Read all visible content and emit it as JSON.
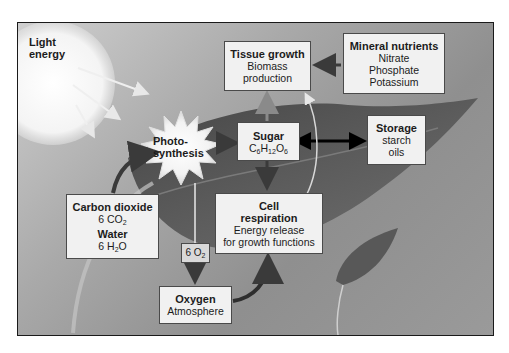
{
  "diagram": {
    "nodes": {
      "light": {
        "line1": "Light",
        "line2": "energy"
      },
      "photosynthesis": {
        "line1": "Photo-",
        "line2": "synthesis"
      },
      "tissue_growth": {
        "title": "Tissue growth",
        "line1": "Biomass",
        "line2": "production"
      },
      "mineral_nutrients": {
        "title": "Mineral nutrients",
        "items": [
          "Nitrate",
          "Phosphate",
          "Potassium"
        ]
      },
      "sugar": {
        "title": "Sugar",
        "formula": {
          "c": "C",
          "c_n": "6",
          "h": "H",
          "h_n": "12",
          "o": "O",
          "o_n": "6"
        }
      },
      "storage": {
        "title": "Storage",
        "items": [
          "starch",
          "oils"
        ]
      },
      "inputs": {
        "co2_title": "Carbon dioxide",
        "co2_formula": {
          "prefix": "6 CO",
          "sub": "2"
        },
        "water_title": "Water",
        "water_formula": {
          "prefix": "6 H",
          "sub": "2",
          "suffix": "O"
        }
      },
      "cell_respiration": {
        "title1": "Cell",
        "title2": "respiration",
        "line1": "Energy release",
        "line2": "for growth functions"
      },
      "o2_output": {
        "prefix": "6 O",
        "sub": "2"
      },
      "oxygen": {
        "title": "Oxygen",
        "line1": "Atmosphere"
      }
    },
    "edges": [
      {
        "from": "light",
        "to": "photosynthesis"
      },
      {
        "from": "inputs",
        "to": "photosynthesis"
      },
      {
        "from": "photosynthesis",
        "to": "sugar"
      },
      {
        "from": "photosynthesis",
        "to": "o2_output"
      },
      {
        "from": "o2_output",
        "to": "oxygen"
      },
      {
        "from": "sugar",
        "to": "tissue_growth"
      },
      {
        "from": "sugar",
        "to": "storage",
        "bidirectional": true
      },
      {
        "from": "sugar",
        "to": "cell_respiration"
      },
      {
        "from": "mineral_nutrients",
        "to": "tissue_growth"
      },
      {
        "from": "cell_respiration",
        "to": "tissue_growth"
      },
      {
        "from": "oxygen",
        "to": "cell_respiration"
      }
    ]
  }
}
